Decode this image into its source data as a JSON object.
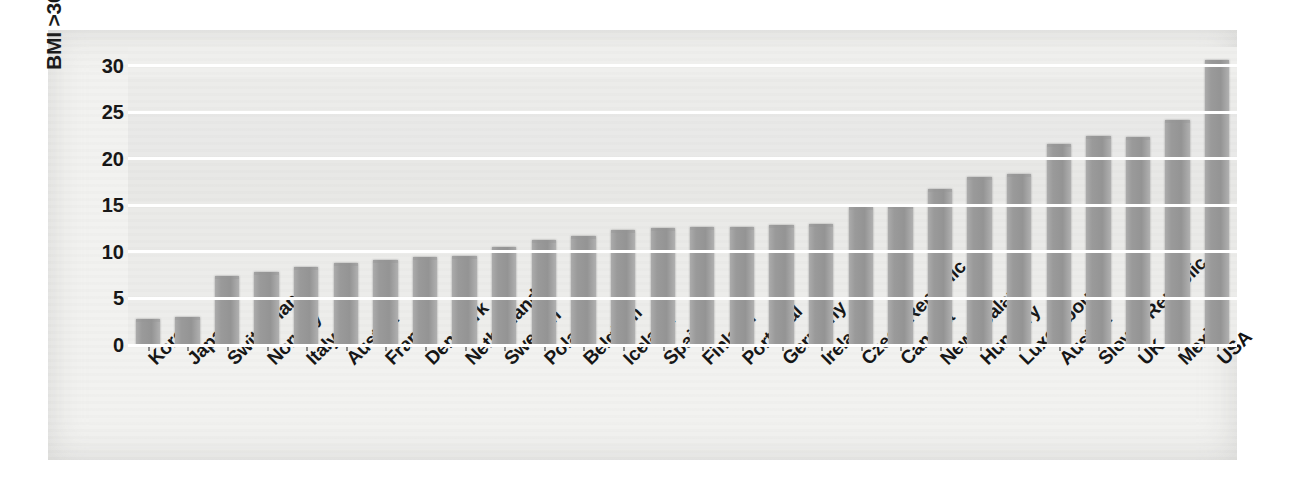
{
  "chart_data": {
    "type": "bar",
    "title": "",
    "xlabel": "",
    "ylabel": "BMI >30 (% population > 15 years)",
    "ylabel_bold_part": "BMI >30",
    "ylabel_regular_part": "(% population > 15 years)",
    "ylim": [
      0,
      32
    ],
    "yticks": [
      0,
      5,
      10,
      15,
      20,
      25,
      30
    ],
    "ytick_labels": [
      "0",
      "5",
      "10",
      "15",
      "20",
      "25",
      "30"
    ],
    "grid": true,
    "legend": "none",
    "bar_color": "#9a9a9a",
    "plot_background": "#efefed",
    "gridline_color": "#ffffff",
    "categories": [
      "Korea",
      "Japan",
      "Switzerland",
      "Norway",
      "Italy",
      "Austria",
      "France",
      "Denmark",
      "Netherlands",
      "Sweden",
      "Poland",
      "Belgium",
      "Iceland",
      "Spain",
      "Finland",
      "Portugal",
      "Germany",
      "Ireland",
      "Czech Republic",
      "Canada",
      "New Zealand",
      "Hungary",
      "Luxembourg",
      "Austria",
      "Slovak Republic",
      "UK",
      "Mexico",
      "USA"
    ],
    "values": [
      2.8,
      3.0,
      7.4,
      7.8,
      8.4,
      8.8,
      9.1,
      9.4,
      9.6,
      10.5,
      11.3,
      11.7,
      12.4,
      12.6,
      12.7,
      12.7,
      12.9,
      13.0,
      14.8,
      14.9,
      16.8,
      18.0,
      18.4,
      21.6,
      22.4,
      22.3,
      24.2,
      30.6
    ]
  }
}
